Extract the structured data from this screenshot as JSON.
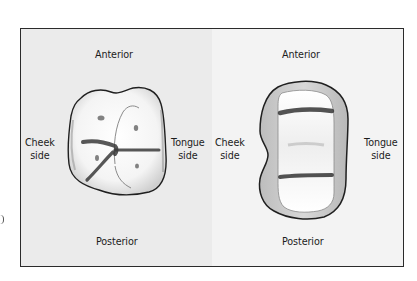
{
  "figure": {
    "type": "dental occlusal view diagram",
    "panels": [
      {
        "id": "left",
        "description": "occlusal surface of molar before preparation",
        "labels": {
          "top": "Anterior",
          "bottom": "Posterior",
          "left": [
            "Cheek",
            "side"
          ],
          "right": [
            "Tongue",
            "side"
          ]
        }
      },
      {
        "id": "right",
        "description": "occlusal surface of molar with two transverse grooves",
        "labels": {
          "top": "Anterior",
          "bottom": "Posterior",
          "left": [
            "Cheek",
            "side"
          ],
          "right": [
            "Tongue",
            "side"
          ]
        }
      }
    ]
  },
  "colors": {
    "frame_border": "#2b2b2b",
    "left_panel_bg": "#ebebeb",
    "right_panel_bg": "#f3f3f3",
    "tooth_outline": "#1f1f1f",
    "groove": "#3a3a3a",
    "label_text": "#1c1c1c"
  }
}
